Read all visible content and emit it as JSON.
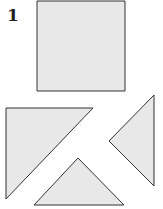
{
  "figure": {
    "label": "1",
    "fill_color": "#e8e8e8",
    "stroke_color": "#333333",
    "shapes": [
      {
        "name": "square",
        "points": "37,1 125,1 125,91 37,91"
      },
      {
        "name": "left-right-triangle",
        "points": "6,108 93,108 6,199"
      },
      {
        "name": "right-triangle",
        "points": "154,95 154,186 109,141"
      },
      {
        "name": "bottom-triangle",
        "points": "78,158 124,205 34,205"
      }
    ]
  }
}
